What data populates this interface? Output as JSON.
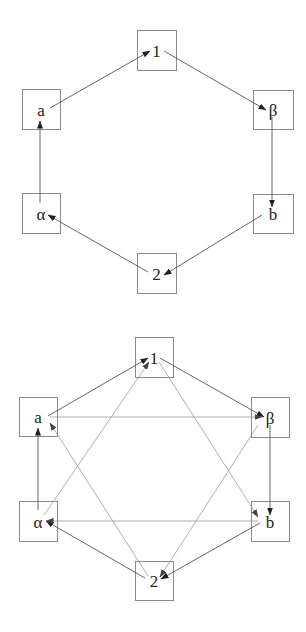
{
  "diagrams": [
    {
      "id": "top",
      "nodes": [
        {
          "id": "1",
          "label": "1",
          "x": 137,
          "y": 30,
          "w": 39,
          "h": 40
        },
        {
          "id": "a",
          "label": "a",
          "x": 22,
          "y": 89,
          "w": 38,
          "h": 40
        },
        {
          "id": "beta",
          "label": "β",
          "x": 253,
          "y": 90,
          "w": 40,
          "h": 39
        },
        {
          "id": "alpha",
          "label": "α",
          "x": 22,
          "y": 193,
          "w": 38,
          "h": 40
        },
        {
          "id": "b",
          "label": "b",
          "x": 253,
          "y": 194,
          "w": 40,
          "h": 39
        },
        {
          "id": "2",
          "label": "2",
          "x": 137,
          "y": 253,
          "w": 39,
          "h": 40
        }
      ],
      "edges": [
        {
          "from": "a",
          "to": "1",
          "style": "outer",
          "p": [
            50,
            108,
            150,
            51
          ]
        },
        {
          "from": "1",
          "to": "beta",
          "style": "outer",
          "p": [
            164,
            51,
            266,
            110
          ]
        },
        {
          "from": "beta",
          "to": "b",
          "style": "outer",
          "p": [
            272,
            117,
            272,
            207
          ]
        },
        {
          "from": "b",
          "to": "2",
          "style": "outer",
          "p": [
            262,
            215,
            164,
            275
          ]
        },
        {
          "from": "2",
          "to": "alpha",
          "style": "outer",
          "p": [
            148,
            272,
            48,
            215
          ]
        },
        {
          "from": "alpha",
          "to": "a",
          "style": "outer",
          "p": [
            40,
            203,
            40,
            121
          ]
        }
      ]
    },
    {
      "id": "bottom",
      "nodes": [
        {
          "id": "1",
          "label": "1",
          "x": 135,
          "y": 337,
          "w": 38,
          "h": 40
        },
        {
          "id": "a",
          "label": "a",
          "x": 19,
          "y": 397,
          "w": 38,
          "h": 39
        },
        {
          "id": "beta",
          "label": "β",
          "x": 251,
          "y": 397,
          "w": 38,
          "h": 40
        },
        {
          "id": "alpha",
          "label": "α",
          "x": 19,
          "y": 501,
          "w": 38,
          "h": 40
        },
        {
          "id": "b",
          "label": "b",
          "x": 251,
          "y": 501,
          "w": 38,
          "h": 40
        },
        {
          "id": "2",
          "label": "2",
          "x": 135,
          "y": 561,
          "w": 38,
          "h": 39
        }
      ],
      "edges": [
        {
          "from": "a",
          "to": "1",
          "style": "outer",
          "p": [
            48,
            416,
            148,
            358
          ]
        },
        {
          "from": "1",
          "to": "beta",
          "style": "outer",
          "p": [
            160,
            358,
            264,
            417
          ]
        },
        {
          "from": "beta",
          "to": "b",
          "style": "outer",
          "p": [
            270,
            425,
            270,
            515
          ]
        },
        {
          "from": "b",
          "to": "2",
          "style": "outer",
          "p": [
            260,
            523,
            161,
            579
          ]
        },
        {
          "from": "2",
          "to": "alpha",
          "style": "outer",
          "p": [
            145,
            578,
            46,
            521
          ]
        },
        {
          "from": "alpha",
          "to": "a",
          "style": "outer",
          "p": [
            38,
            510,
            38,
            428
          ]
        },
        {
          "from": "a",
          "to": "beta",
          "style": "inner",
          "p": [
            50,
            417,
            262,
            417
          ]
        },
        {
          "from": "b",
          "to": "alpha",
          "style": "inner",
          "p": [
            258,
            521,
            46,
            521
          ]
        },
        {
          "from": "alpha",
          "to": "1",
          "style": "inner",
          "p": [
            44,
            515,
            149,
            362
          ]
        },
        {
          "from": "1",
          "to": "b",
          "style": "inner",
          "p": [
            159,
            362,
            258,
            517
          ]
        },
        {
          "from": "beta",
          "to": "2",
          "style": "inner",
          "p": [
            258,
            425,
            160,
            577
          ]
        },
        {
          "from": "2",
          "to": "a",
          "style": "inner",
          "p": [
            148,
            576,
            50,
            423
          ]
        }
      ]
    }
  ]
}
